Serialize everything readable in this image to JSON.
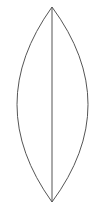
{
  "diagram": {
    "type": "lens-shape",
    "stroke_color": "#555555",
    "background_color": "#ffffff",
    "top_point": {
      "x": 52,
      "y": 7
    },
    "bottom_point": {
      "x": 52,
      "y": 202
    },
    "left_extent_x": 17,
    "right_extent_x": 88
  }
}
